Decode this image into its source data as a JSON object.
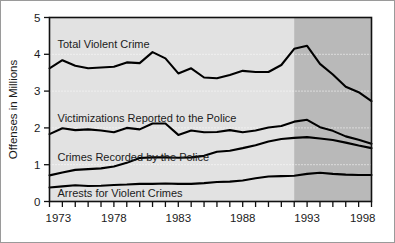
{
  "chart_data": {
    "type": "line",
    "title": "",
    "xlabel": "",
    "ylabel": "Offenses in Millions",
    "xlim": [
      1973,
      1998
    ],
    "ylim": [
      0,
      5
    ],
    "yticks": [
      0,
      1,
      2,
      3,
      4,
      5
    ],
    "ytick_labels": [
      "0",
      "1",
      "2",
      "3",
      "4",
      "5"
    ],
    "xticks": [
      1973,
      1974,
      1975,
      1976,
      1977,
      1978,
      1979,
      1980,
      1981,
      1982,
      1983,
      1984,
      1985,
      1986,
      1987,
      1988,
      1989,
      1990,
      1991,
      1992,
      1993,
      1994,
      1995,
      1996,
      1997,
      1998
    ],
    "xtick_labels_shown": [
      "1973",
      "1978",
      "1983",
      "1988",
      "1993",
      "1998"
    ],
    "xtick_labels_shown_at": [
      1973,
      1978,
      1983,
      1988,
      1993,
      1998
    ],
    "grid": "horizontal-dotted",
    "legend_position": "inline-labels",
    "plot_background": "#e2e2e2",
    "shaded_band": {
      "label": "",
      "x_start": 1992,
      "x_end": 1998,
      "color": "#b9b9b9"
    },
    "line_color": "#000000",
    "x": [
      1973,
      1974,
      1975,
      1976,
      1977,
      1978,
      1979,
      1980,
      1981,
      1982,
      1983,
      1984,
      1985,
      1986,
      1987,
      1988,
      1989,
      1990,
      1991,
      1992,
      1993,
      1994,
      1995,
      1996,
      1997,
      1998
    ],
    "series": [
      {
        "name": "Total Violent Crime",
        "label_text": "Total Violent Crime",
        "values": [
          3.62,
          3.84,
          3.69,
          3.62,
          3.64,
          3.66,
          3.78,
          3.76,
          4.06,
          3.89,
          3.48,
          3.62,
          3.37,
          3.35,
          3.44,
          3.55,
          3.52,
          3.52,
          3.71,
          4.15,
          4.23,
          3.74,
          3.45,
          3.12,
          2.97,
          2.73
        ]
      },
      {
        "name": "Victimizations Reported to the Police",
        "label_text": "Victimizations Reported to the Police",
        "values": [
          1.83,
          1.99,
          1.94,
          1.96,
          1.93,
          1.88,
          2.0,
          1.96,
          2.12,
          2.12,
          1.81,
          1.93,
          1.88,
          1.89,
          1.94,
          1.88,
          1.93,
          2.01,
          2.05,
          2.17,
          2.22,
          2.02,
          1.92,
          1.77,
          1.68,
          1.57
        ]
      },
      {
        "name": "Crimes Recorded by the Police",
        "label_text": "Crimes Recorded by the Police",
        "values": [
          0.71,
          0.79,
          0.86,
          0.88,
          0.9,
          0.95,
          1.05,
          1.18,
          1.2,
          1.2,
          1.19,
          1.2,
          1.24,
          1.35,
          1.38,
          1.45,
          1.53,
          1.63,
          1.7,
          1.73,
          1.75,
          1.71,
          1.67,
          1.6,
          1.52,
          1.45
        ]
      },
      {
        "name": "Arrests for Violent Crimes",
        "label_text": "Arrests for Violent Crimes",
        "values": [
          0.38,
          0.41,
          0.44,
          0.42,
          0.43,
          0.45,
          0.46,
          0.48,
          0.48,
          0.49,
          0.48,
          0.48,
          0.5,
          0.53,
          0.54,
          0.57,
          0.63,
          0.68,
          0.69,
          0.7,
          0.75,
          0.78,
          0.75,
          0.73,
          0.72,
          0.72
        ]
      }
    ]
  }
}
